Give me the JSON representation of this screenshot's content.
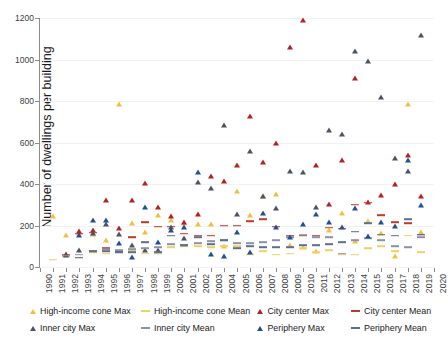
{
  "chart_data": {
    "type": "scatter",
    "title": "",
    "xlabel": "",
    "ylabel": "Number of dwellings per building",
    "xlim": [
      1990,
      2020
    ],
    "ylim": [
      0,
      1200
    ],
    "y_ticks": [
      0,
      200,
      400,
      600,
      800,
      1000,
      1200
    ],
    "x_ticks": [
      1990,
      1991,
      1992,
      1993,
      1994,
      1995,
      1996,
      1997,
      1998,
      1999,
      2000,
      2001,
      2002,
      2003,
      2004,
      2005,
      2006,
      2007,
      2008,
      2009,
      2010,
      2011,
      2012,
      2013,
      2014,
      2015,
      2016,
      2017,
      2018,
      2019,
      2020
    ],
    "grid": true,
    "legend_position": "bottom",
    "x": [
      1991,
      1992,
      1993,
      1994,
      1995,
      1996,
      1997,
      1998,
      1999,
      2000,
      2001,
      2002,
      2003,
      2004,
      2005,
      2006,
      2007,
      2008,
      2009,
      2010,
      2011,
      2012,
      2013,
      2014,
      2015,
      2016,
      2017,
      2018,
      2019
    ],
    "series": [
      {
        "name": "High-income cone Max",
        "color": "#f0c040",
        "marker": "triangle",
        "values": [
          245,
          155,
          165,
          160,
          130,
          785,
          210,
          170,
          250,
          225,
          210,
          205,
          205,
          100,
          365,
          250,
          340,
          350,
          105,
          95,
          75,
          180,
          260,
          125,
          220,
          165,
          55,
          785,
          170
        ]
      },
      {
        "name": "High-income cone Mean",
        "color": "#f2cf63",
        "marker": "dash",
        "values": [
          35,
          50,
          45,
          70,
          65,
          70,
          75,
          65,
          65,
          95,
          100,
          100,
          95,
          100,
          100,
          60,
          75,
          60,
          65,
          90,
          70,
          80,
          60,
          60,
          90,
          100,
          75,
          150,
          70
        ]
      },
      {
        "name": "City center Max",
        "color": "#b62020",
        "marker": "triangle",
        "values": [
          null,
          65,
          175,
          180,
          325,
          190,
          325,
          405,
          290,
          245,
          215,
          255,
          440,
          415,
          490,
          730,
          505,
          600,
          1060,
          1190,
          490,
          305,
          515,
          910,
          315,
          345,
          400,
          540,
          340
        ]
      },
      {
        "name": "City center Mean",
        "color": "#c0392b",
        "marker": "dash",
        "values": [
          null,
          60,
          160,
          165,
          90,
          75,
          145,
          215,
          195,
          195,
          160,
          150,
          150,
          200,
          200,
          220,
          230,
          195,
          150,
          150,
          150,
          190,
          185,
          300,
          310,
          250,
          215,
          210,
          155
        ]
      },
      {
        "name": "Inner city Max",
        "color": "#4a5463",
        "marker": "triangle",
        "values": [
          null,
          60,
          80,
          165,
          205,
          160,
          105,
          80,
          80,
          195,
          140,
          410,
          380,
          685,
          255,
          560,
          340,
          285,
          465,
          460,
          290,
          660,
          640,
          1040,
          995,
          820,
          525,
          465,
          1120
        ]
      },
      {
        "name": "Inner city Mean",
        "color": "#8a93a3",
        "marker": "dash",
        "values": [
          null,
          55,
          60,
          75,
          85,
          80,
          85,
          90,
          95,
          110,
          105,
          115,
          125,
          130,
          115,
          115,
          120,
          130,
          145,
          155,
          145,
          145,
          65,
          130,
          140,
          130,
          100,
          95,
          145
        ]
      },
      {
        "name": "Periphery Max",
        "color": "#1f4e9c",
        "marker": "triangle",
        "values": [
          null,
          null,
          155,
          225,
          225,
          115,
          50,
          290,
          120,
          180,
          195,
          460,
          65,
          55,
          170,
          70,
          260,
          195,
          145,
          205,
          255,
          215,
          195,
          285,
          150,
          215,
          200,
          515,
          300
        ]
      },
      {
        "name": "Periphery Mean",
        "color": "#5c6f8c",
        "marker": "dash",
        "values": [
          null,
          null,
          45,
          75,
          75,
          70,
          70,
          120,
          70,
          150,
          105,
          145,
          110,
          130,
          90,
          100,
          95,
          95,
          95,
          105,
          105,
          110,
          120,
          170,
          210,
          155,
          150,
          230,
          155
        ]
      }
    ]
  },
  "legend": {
    "items": [
      {
        "label": "High-income cone Max",
        "marker": "triangle",
        "color": "#f0c040",
        "icon": "triangle-marker-icon"
      },
      {
        "label": "High-income cone Mean",
        "marker": "dash",
        "color": "#f2cf63",
        "icon": "dash-marker-icon"
      },
      {
        "label": "City center Max",
        "marker": "triangle",
        "color": "#b62020",
        "icon": "triangle-marker-icon"
      },
      {
        "label": "City center Mean",
        "marker": "dash",
        "color": "#c0392b",
        "icon": "dash-marker-icon"
      },
      {
        "label": "Inner city Max",
        "marker": "triangle",
        "color": "#4a5463",
        "icon": "triangle-marker-icon"
      },
      {
        "label": "Inner city Mean",
        "marker": "dash",
        "color": "#8a93a3",
        "icon": "dash-marker-icon"
      },
      {
        "label": "Periphery Max",
        "marker": "triangle",
        "color": "#1f4e9c",
        "icon": "triangle-marker-icon"
      },
      {
        "label": "Periphery Mean",
        "marker": "dash",
        "color": "#5c6f8c",
        "icon": "dash-marker-icon"
      }
    ]
  }
}
